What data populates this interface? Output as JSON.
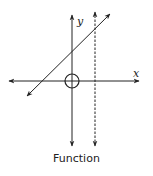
{
  "caption": "Function",
  "axes": {
    "x_label": "x",
    "y_label": "y"
  },
  "elements": {
    "line": "diagonal line with arrows at both ends",
    "vertical_test_line": "dashed vertical line with arrows at both ends",
    "origin_marker": "circle at origin"
  },
  "colors": {
    "stroke": "#222222",
    "background": "#ffffff"
  }
}
